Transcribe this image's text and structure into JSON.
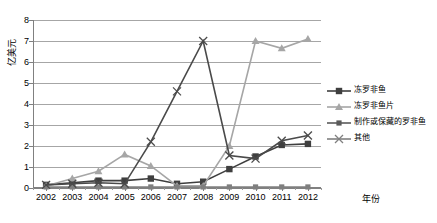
{
  "chart_data": {
    "type": "line",
    "title": "",
    "xlabel": "年份",
    "ylabel": "亿美元",
    "categories": [
      "2002",
      "2003",
      "2004",
      "2005",
      "2006",
      "2007",
      "2008",
      "2009",
      "2010",
      "2011",
      "2012"
    ],
    "x": [
      2002,
      2003,
      2004,
      2005,
      2006,
      2007,
      2008,
      2009,
      2010,
      2011,
      2012
    ],
    "ylim": [
      0,
      8
    ],
    "yticks": [
      0,
      1,
      2,
      3,
      4,
      5,
      6,
      7,
      8
    ],
    "grid": true,
    "legend_position": "right",
    "series": [
      {
        "name": "冻罗非鱼",
        "marker": "square",
        "color": "#3f3f3f",
        "values": [
          0.15,
          0.25,
          0.35,
          0.35,
          0.45,
          0.2,
          0.3,
          0.9,
          1.5,
          2.05,
          2.1
        ]
      },
      {
        "name": "冻罗非鱼片",
        "marker": "triangle",
        "color": "#a6a6a6",
        "values": [
          0.1,
          0.45,
          0.8,
          1.6,
          1.05,
          0.1,
          0.1,
          2.0,
          7.0,
          6.65,
          7.1
        ]
      },
      {
        "name": "制作或保藏的罗非鱼",
        "marker": "square-small",
        "color": "#7f7f7f",
        "values": [
          0.05,
          0.05,
          0.05,
          0.05,
          0.05,
          0.05,
          0.05,
          0.05,
          0.05,
          0.05,
          0.05
        ]
      },
      {
        "name": "其他",
        "marker": "x",
        "color": "#4a4a4a",
        "values": [
          0.15,
          0.2,
          0.25,
          0.2,
          2.2,
          4.6,
          7.0,
          1.55,
          1.4,
          2.25,
          2.5
        ]
      }
    ]
  },
  "axes": {
    "y_title": "亿美元",
    "x_title": "年份",
    "y_tick_labels": [
      "0",
      "1",
      "2",
      "3",
      "4",
      "5",
      "6",
      "7",
      "8"
    ],
    "x_tick_labels": [
      "2002",
      "2003",
      "2004",
      "2005",
      "2006",
      "2007",
      "2008",
      "2009",
      "2010",
      "2011",
      "2012"
    ]
  },
  "legend": {
    "items": [
      {
        "label": "冻罗非鱼",
        "color": "#3f3f3f",
        "marker": "square"
      },
      {
        "label": "冻罗非鱼片",
        "color": "#a6a6a6",
        "marker": "triangle"
      },
      {
        "label": "制作或保藏的罗非鱼",
        "color": "#5a5a5a",
        "marker": "square-small"
      },
      {
        "label": "其他",
        "color": "#808080",
        "marker": "x"
      }
    ]
  },
  "colors": {
    "grid": "#a6a6a6",
    "axis": "#808080",
    "background": "#ffffff",
    "text": "#000000"
  }
}
